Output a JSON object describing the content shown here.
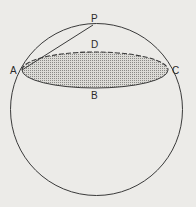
{
  "diagram": {
    "labels": {
      "P": "P",
      "D": "D",
      "A": "A",
      "C": "C",
      "B": "B"
    },
    "colors": {
      "stroke": "#3a3a3a",
      "shade": "#bdbcb8",
      "background": "#ecebe8"
    }
  }
}
